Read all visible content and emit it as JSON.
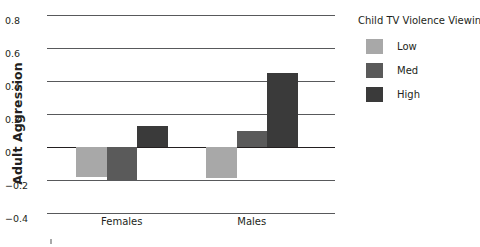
{
  "chart_data": {
    "type": "bar",
    "title": "",
    "xlabel": "",
    "ylabel": "Adult Aggression",
    "categories": [
      "Females",
      "Males"
    ],
    "series": [
      {
        "name": "Low",
        "color": "#a8a8a8",
        "values": [
          -0.18,
          -0.19
        ]
      },
      {
        "name": "Med",
        "color": "#5a5a5a",
        "values": [
          -0.2,
          0.1
        ]
      },
      {
        "name": "High",
        "color": "#3a3a3a",
        "values": [
          0.13,
          0.45
        ]
      }
    ],
    "ylim": [
      -0.4,
      0.8
    ],
    "ytick_labels": [
      "0.8",
      "0.6",
      "0.4",
      "0.2",
      "0",
      "−0.2",
      "−0.4"
    ],
    "ytick_values": [
      0.8,
      0.6,
      0.4,
      0.2,
      0,
      -0.2,
      -0.4
    ],
    "grid": true,
    "legend_position": "right",
    "legend_title": "Child TV Violence Viewing"
  },
  "axis": {
    "y_title": "Adult Aggression"
  },
  "legend": {
    "title": "Child TV Violence Viewing",
    "items": [
      {
        "label": "Low"
      },
      {
        "label": "Med"
      },
      {
        "label": "High"
      }
    ]
  }
}
